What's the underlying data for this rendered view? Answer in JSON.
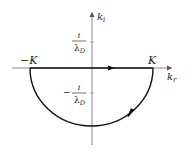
{
  "diagram": {
    "type": "complex-plane contour",
    "axes": {
      "horizontal": {
        "label_main": "k",
        "label_sub": "r"
      },
      "vertical": {
        "label_main": "k",
        "label_sub": "i"
      }
    },
    "points": {
      "left_endpoint": {
        "label": "−K"
      },
      "right_endpoint": {
        "label": "K"
      }
    },
    "tick_labels": {
      "upper": {
        "numerator": "i",
        "denominator_main": "λ",
        "denominator_sub": "D",
        "sign": ""
      },
      "lower": {
        "numerator": "i",
        "denominator_main": "λ",
        "denominator_sub": "D",
        "sign": "−"
      }
    },
    "contour": {
      "segments": [
        "real-axis segment from −K to K (arrow pointing right)",
        "lower semicircle from K back to −K (arrow clockwise)"
      ],
      "color": "#111111"
    },
    "axis_color": "#777777"
  }
}
